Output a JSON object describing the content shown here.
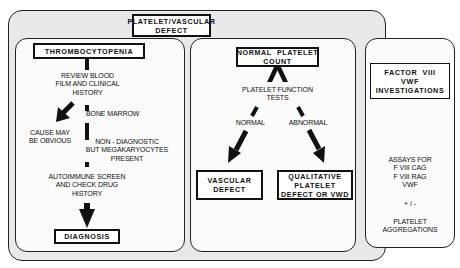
{
  "title": "PLATELET/VASCULAR DEFECT",
  "title_lines": [
    "PLATELET/VASCULAR",
    "DEFECT"
  ],
  "left_panel": {
    "header": "THROMBOCYTOPENIA",
    "step1": [
      "REVIEW BLOOD",
      "FILM AND CLINICAL",
      "HISTORY"
    ],
    "branch_left": [
      "CAUSE MAY",
      "BE OBVIOUS"
    ],
    "step2": "BONE MARROW",
    "step2_result": [
      "NON - DIAGNOSTIC",
      "BUT MEGAKARYOCYTES",
      "PRESENT"
    ],
    "step3": [
      "AUTOIMMUNE SCREEN",
      "AND CHECK DRUG",
      "HISTORY"
    ],
    "result": "DIAGNOSIS"
  },
  "middle_panel": {
    "header": [
      "NORMAL  PLATELET",
      "COUNT"
    ],
    "test": [
      "PLATELET FUNCTION",
      "TESTS"
    ],
    "branch_normal": "NORMAL",
    "branch_abnormal": "ABNORMAL",
    "result_normal": [
      "VASCULAR",
      "DEFECT"
    ],
    "result_abnormal": [
      "QUALITATIVE",
      "PLATELET",
      "DEFECT OR VWD"
    ]
  },
  "right_panel": {
    "header": [
      "FACTOR  VIII",
      "VWF",
      "INVESTIGATIONS"
    ],
    "assays": [
      "ASSAYS FOR",
      "F VIII CAG",
      "F VIII RAG",
      "VWF"
    ],
    "plus_minus": "+ / -",
    "aggregations": [
      "PLATELET",
      "AGGREGATIONS"
    ]
  }
}
